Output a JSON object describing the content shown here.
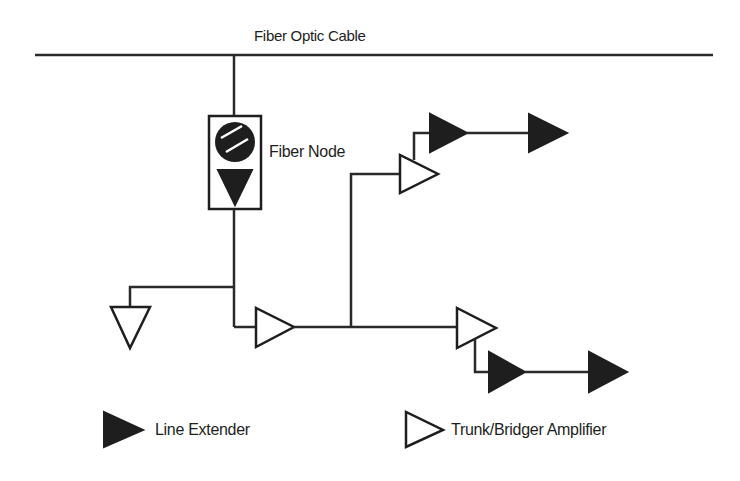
{
  "diagram": {
    "title": "Fiber Optic Cable",
    "node_label": "Fiber Node",
    "legend": {
      "line_extender": "Line Extender",
      "trunk_bridger": "Trunk/Bridger Amplifier"
    },
    "components": {
      "fiber_node": 1,
      "trunk_bridger_amplifiers": 4,
      "line_extenders": 4
    },
    "colors": {
      "stroke": "#1e1e1e",
      "background": "#ffffff"
    }
  }
}
